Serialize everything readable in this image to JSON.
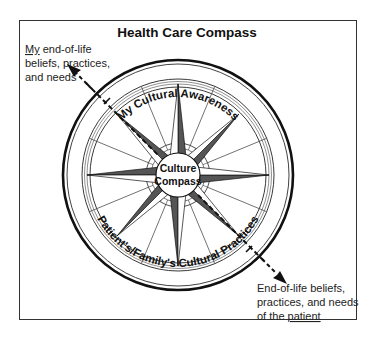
{
  "title": "Health Care Compass",
  "left_label": {
    "emphasis": "My",
    "line1_rest": " end-of-life",
    "line2": "beliefs, practices,",
    "line3": "and needs"
  },
  "right_label": {
    "line1": "End-of-life beliefs,",
    "line2": "practices, and needs",
    "line3_prefix": "of the ",
    "emphasis": "patient"
  },
  "top_arc_text": "My Cultural Awareness",
  "bottom_arc_text": "Patient's/Family's Cultural Practices",
  "center": {
    "line1": "Culture",
    "line2": "Compass"
  },
  "icons": {
    "arrow_top_left": "arrow-up-left-icon",
    "arrow_bottom_right": "arrow-down-right-icon",
    "compass_rose": "compass-rose-icon"
  },
  "colors": {
    "ink": "#111111",
    "point_fill_dark": "#555555",
    "point_fill_light": "#ffffff",
    "frame": "#333333"
  }
}
